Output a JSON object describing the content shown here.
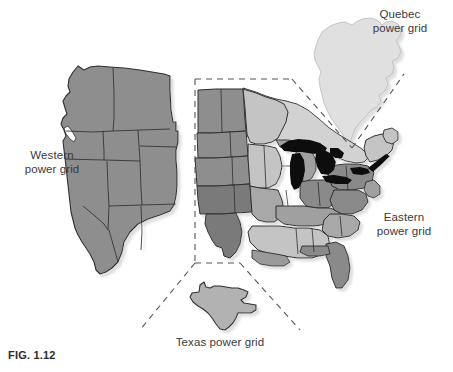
{
  "figure": {
    "caption": "FIG. 1.12",
    "background_color": "#ffffff"
  },
  "labels": {
    "western": "Western\npower grid",
    "eastern": "Eastern\npower grid",
    "quebec": "Quebec\npower grid",
    "texas": "Texas power grid"
  },
  "colors": {
    "western_fill": "#8e8e8e",
    "quebec_fill": "#e0e0e0",
    "texas_fill": "#b2b2b2",
    "great_lakes_fill": "#0a0a0a",
    "canada_fill": "#d2d2d2",
    "outline": "#2f2f2f",
    "dashed_line": "#555555",
    "shadow": "#c9c9c9",
    "eastern_light": "#c4c4c4",
    "eastern_mid": "#aaaaaa",
    "eastern_dark": "#8a8a8a",
    "eastern_darker": "#767676",
    "label_text": "#3a3a3a"
  },
  "regions": [
    {
      "name": "western-power-grid",
      "label": "Western power grid",
      "fill": "#8e8e8e"
    },
    {
      "name": "eastern-power-grid",
      "label": "Eastern power grid",
      "fill": "#aaaaaa"
    },
    {
      "name": "quebec-power-grid",
      "label": "Quebec power grid",
      "fill": "#e0e0e0"
    },
    {
      "name": "texas-power-grid",
      "label": "Texas power grid",
      "fill": "#b2b2b2"
    }
  ],
  "annotations": {
    "texas_callout": "dashed lines connecting Texas inset to the Eastern map region",
    "quebec_callout": "dashed V connecting Quebec shape to the Eastern map region"
  }
}
